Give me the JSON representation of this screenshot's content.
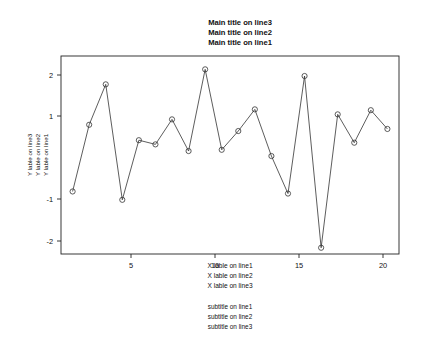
{
  "chart_data": {
    "type": "line",
    "title_lines": [
      "Main title on line3",
      "Main title on line2",
      "Main title on line1"
    ],
    "xlabel_lines": [
      "X lable on line1",
      "X lable on line2",
      "X lable on line3"
    ],
    "ylabel_lines": [
      "Y lable on line3",
      "Y lable on line2",
      "Y lable on line1"
    ],
    "subtitle_lines": [
      "subtitle on line1",
      "subtitle on line2",
      "subtitle on line3"
    ],
    "xticks": [
      5,
      10,
      15,
      20
    ],
    "yticks": [
      -2,
      -1,
      1,
      2
    ],
    "xlim": [
      0.3,
      20.7
    ],
    "ylim": [
      -2.45,
      2.3
    ],
    "grid": false,
    "legend": "none",
    "marker": "open-circle",
    "x": [
      1,
      2,
      3,
      4,
      5,
      6,
      7,
      8,
      9,
      10,
      11,
      12,
      13,
      14,
      15,
      16,
      17,
      18,
      19,
      20
    ],
    "values": [
      -0.95,
      0.65,
      1.62,
      -1.15,
      0.28,
      0.18,
      0.78,
      0.02,
      1.98,
      0.05,
      0.5,
      1.02,
      -0.1,
      -1.0,
      1.82,
      -2.3,
      0.9,
      0.22,
      1.0,
      0.55
    ],
    "series": [
      {
        "name": "series-1",
        "values": [
          -0.95,
          0.65,
          1.62,
          -1.15,
          0.28,
          0.18,
          0.78,
          0.02,
          1.98,
          0.05,
          0.5,
          1.02,
          -0.1,
          -1.0,
          1.82,
          -2.3,
          0.9,
          0.22,
          1.0,
          0.55
        ]
      }
    ]
  },
  "axis": {
    "xtick_labels": [
      "5",
      "10",
      "15",
      "20"
    ],
    "ytick_labels": [
      "-2",
      "-1",
      "1",
      "2"
    ]
  }
}
